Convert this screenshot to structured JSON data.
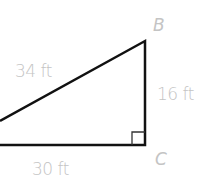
{
  "diagram": {
    "type": "right-triangle",
    "vertices": {
      "B": {
        "label": "B"
      },
      "C": {
        "label": "C"
      }
    },
    "sides": {
      "hypotenuse": {
        "label": "34 ft"
      },
      "vertical": {
        "label": "16 ft"
      },
      "base": {
        "label": "30 ft"
      }
    },
    "right_angle_at": "C",
    "colors": {
      "stroke": "#111111",
      "label": "#c4c4c4",
      "background": "#ffffff"
    }
  }
}
